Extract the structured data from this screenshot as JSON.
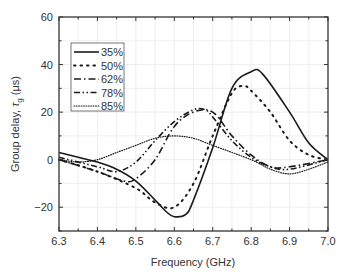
{
  "chart_data": {
    "type": "line",
    "title": "",
    "xlabel": "Frequency (GHz)",
    "ylabel_parts": [
      "Group delay, ",
      "τ",
      "g",
      " (μs)"
    ],
    "ylabel": "Group delay, τg (μs)",
    "xlim": [
      6.3,
      7.0
    ],
    "ylim": [
      -30,
      60
    ],
    "xticks": [
      6.3,
      6.4,
      6.5,
      6.6,
      6.7,
      6.8,
      6.9,
      7.0
    ],
    "xtick_labels": [
      "6.3",
      "6.4",
      "6.5",
      "6.6",
      "6.7",
      "6.8",
      "6.9",
      "7.0"
    ],
    "yticks": [
      -20,
      0,
      20,
      40,
      60
    ],
    "ytick_labels": [
      "−20",
      "0",
      "20",
      "40",
      "60"
    ],
    "grid": true,
    "legend_position": "upper left",
    "series": [
      {
        "name": "35%",
        "style": "solid",
        "x": [
          6.3,
          6.35,
          6.4,
          6.45,
          6.5,
          6.55,
          6.58,
          6.6,
          6.63,
          6.65,
          6.7,
          6.75,
          6.8,
          6.83,
          6.9,
          6.95,
          7.0
        ],
        "y": [
          3,
          1,
          -1,
          -4,
          -9,
          -17,
          -22,
          -24,
          -23,
          -17,
          5,
          30,
          37,
          36,
          20,
          7,
          0
        ]
      },
      {
        "name": "50%",
        "style": "dotted-sparse",
        "x": [
          6.3,
          6.4,
          6.5,
          6.55,
          6.6,
          6.65,
          6.7,
          6.75,
          6.78,
          6.8,
          6.85,
          6.9,
          6.95,
          7.0
        ],
        "y": [
          0,
          -5,
          -12,
          -18,
          -20,
          -10,
          10,
          28,
          31,
          29,
          20,
          8,
          2,
          0
        ]
      },
      {
        "name": "62%",
        "style": "dash-dot",
        "x": [
          6.3,
          6.4,
          6.47,
          6.5,
          6.55,
          6.6,
          6.65,
          6.7,
          6.75,
          6.8,
          6.85,
          6.9,
          7.0
        ],
        "y": [
          0,
          -5,
          -9,
          -8,
          0,
          14,
          20,
          20,
          10,
          2,
          -3,
          -3,
          0
        ]
      },
      {
        "name": "78%",
        "style": "dash-dot-dot",
        "x": [
          6.3,
          6.4,
          6.45,
          6.5,
          6.55,
          6.6,
          6.65,
          6.68,
          6.7,
          6.75,
          6.8,
          6.85,
          6.9,
          7.0
        ],
        "y": [
          1,
          -3,
          -5,
          -1,
          8,
          16,
          21,
          21,
          18,
          8,
          1,
          -3,
          -4,
          0
        ]
      },
      {
        "name": "85%",
        "style": "dotted-fine",
        "x": [
          6.3,
          6.35,
          6.4,
          6.45,
          6.5,
          6.55,
          6.6,
          6.65,
          6.7,
          6.8,
          6.85,
          6.9,
          6.95,
          7.0
        ],
        "y": [
          0,
          -1,
          0,
          3,
          6,
          9,
          10,
          9,
          6,
          0,
          -4,
          -6,
          -4,
          -1
        ]
      }
    ]
  },
  "legend": {
    "items": [
      "35%",
      "50%",
      "62%",
      "78%",
      "85%"
    ]
  },
  "colors": {
    "line": "#1a1a1a",
    "axis": "#333333",
    "grid": "#e6e6e6"
  }
}
